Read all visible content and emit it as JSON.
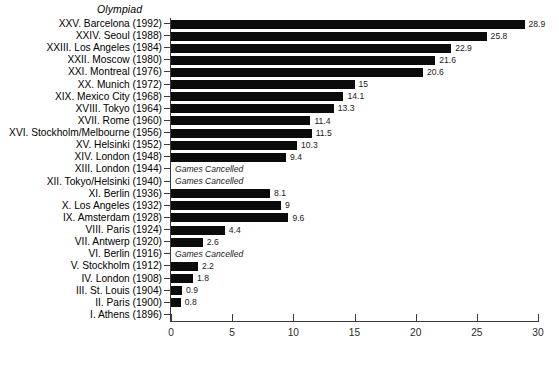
{
  "chart_data": {
    "type": "bar",
    "orientation": "horizontal",
    "title": "Olympiad",
    "xlabel": "",
    "ylabel": "",
    "xlim": [
      0,
      30
    ],
    "xticks": [
      0,
      5,
      10,
      15,
      20,
      25,
      30
    ],
    "grid": false,
    "legend": null,
    "bar_color": "#0b0b0b",
    "axis_color": "#3a3a3a",
    "cancelled_note": "Games Cancelled",
    "categories": [
      "XXV. Barcelona (1992)",
      "XXIV. Seoul (1988)",
      "XXIII. Los Angeles (1984)",
      "XXII. Moscow (1980)",
      "XXI. Montreal (1976)",
      "XX. Munich (1972)",
      "XIX. Mexico City (1968)",
      "XVIII. Tokyo (1964)",
      "XVII. Rome (1960)",
      "XVI. Stockholm/Melbourne (1956)",
      "XV. Helsinki (1952)",
      "XIV. London (1948)",
      "XIII. London (1944)",
      "XII. Tokyo/Helsinki (1940)",
      "XI. Berlin (1936)",
      "X. Los Angeles (1932)",
      "IX. Amsterdam (1928)",
      "VIII. Paris (1924)",
      "VII. Antwerp (1920)",
      "VI. Berlin (1916)",
      "V. Stockholm (1912)",
      "IV. London (1908)",
      "III. St. Louis (1904)",
      "II. Paris (1900)",
      "I. Athens (1896)"
    ],
    "values": [
      28.9,
      25.8,
      22.9,
      21.6,
      20.6,
      15,
      14.1,
      13.3,
      11.4,
      11.5,
      10.3,
      9.4,
      null,
      null,
      8.1,
      9,
      9.6,
      4.4,
      2.6,
      null,
      2.2,
      1.8,
      0.9,
      0.8,
      0
    ],
    "value_labels": [
      "28.9",
      "25.8",
      "22.9",
      "21.6",
      "20.6",
      "15",
      "14.1",
      "13.3",
      "11.4",
      "11.5",
      "10.3",
      "9.4",
      "",
      "",
      "8.1",
      "9",
      "9.6",
      "4.4",
      "2.6",
      "",
      "2.2",
      "1.8",
      "0.9",
      "0.8",
      ""
    ],
    "cancelled": [
      false,
      false,
      false,
      false,
      false,
      false,
      false,
      false,
      false,
      false,
      false,
      false,
      true,
      true,
      false,
      false,
      false,
      false,
      false,
      true,
      false,
      false,
      false,
      false,
      false
    ]
  }
}
